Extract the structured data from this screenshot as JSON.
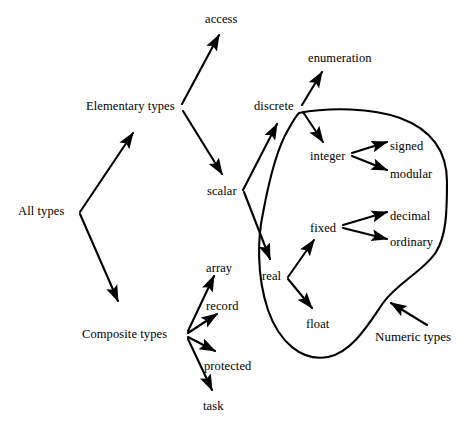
{
  "diagram": {
    "stroke_color": "#000000",
    "background_color": "#ffffff",
    "nodes": [
      {
        "id": "all_types",
        "label": "All types",
        "x": 18,
        "y": 205
      },
      {
        "id": "elementary_types",
        "label": "Elementary types",
        "x": 86,
        "y": 100
      },
      {
        "id": "composite_types",
        "label": "Composite types",
        "x": 82,
        "y": 328
      },
      {
        "id": "access",
        "label": "access",
        "x": 205,
        "y": 13
      },
      {
        "id": "scalar",
        "label": "scalar",
        "x": 207,
        "y": 185
      },
      {
        "id": "discrete",
        "label": "discrete",
        "x": 254,
        "y": 100
      },
      {
        "id": "real",
        "label": "real",
        "x": 262,
        "y": 270
      },
      {
        "id": "enumeration",
        "label": "enumeration",
        "x": 308,
        "y": 52
      },
      {
        "id": "integer",
        "label": "integer",
        "x": 310,
        "y": 150
      },
      {
        "id": "signed",
        "label": "signed",
        "x": 390,
        "y": 140
      },
      {
        "id": "modular",
        "label": "modular",
        "x": 390,
        "y": 168
      },
      {
        "id": "fixed",
        "label": "fixed",
        "x": 310,
        "y": 222
      },
      {
        "id": "decimal",
        "label": "decimal",
        "x": 390,
        "y": 210
      },
      {
        "id": "ordinary",
        "label": "ordinary",
        "x": 390,
        "y": 236
      },
      {
        "id": "float",
        "label": "float",
        "x": 306,
        "y": 318
      },
      {
        "id": "array",
        "label": "array",
        "x": 206,
        "y": 262
      },
      {
        "id": "record",
        "label": "record",
        "x": 206,
        "y": 300
      },
      {
        "id": "protected",
        "label": "protected",
        "x": 204,
        "y": 360
      },
      {
        "id": "task",
        "label": "task",
        "x": 203,
        "y": 400
      }
    ],
    "annotations": [
      {
        "id": "numeric_types",
        "label": "Numeric types",
        "x": 375,
        "y": 330
      }
    ],
    "edges": [
      {
        "from": "all_types",
        "to": "elementary_types"
      },
      {
        "from": "all_types",
        "to": "composite_types"
      },
      {
        "from": "elementary_types",
        "to": "access"
      },
      {
        "from": "elementary_types",
        "to": "scalar"
      },
      {
        "from": "scalar",
        "to": "discrete"
      },
      {
        "from": "scalar",
        "to": "real"
      },
      {
        "from": "discrete",
        "to": "enumeration"
      },
      {
        "from": "discrete",
        "to": "integer"
      },
      {
        "from": "real",
        "to": "fixed"
      },
      {
        "from": "real",
        "to": "float"
      },
      {
        "from": "integer",
        "to": "signed"
      },
      {
        "from": "integer",
        "to": "modular"
      },
      {
        "from": "fixed",
        "to": "decimal"
      },
      {
        "from": "fixed",
        "to": "ordinary"
      },
      {
        "from": "composite_types",
        "to": "array"
      },
      {
        "from": "composite_types",
        "to": "record"
      },
      {
        "from": "composite_types",
        "to": "protected"
      },
      {
        "from": "composite_types",
        "to": "task"
      },
      {
        "from": "numeric_types",
        "to": "numeric_region"
      }
    ],
    "regions": [
      {
        "id": "numeric_region",
        "label": "Numeric types",
        "contains": [
          "integer",
          "signed",
          "modular",
          "fixed",
          "decimal",
          "ordinary",
          "float"
        ]
      }
    ]
  }
}
